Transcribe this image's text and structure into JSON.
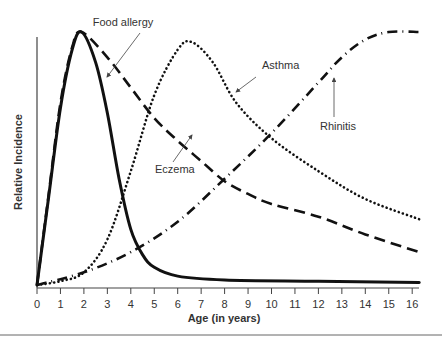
{
  "chart_data": {
    "type": "line",
    "title": "",
    "xlabel": "Age (in years)",
    "ylabel": "Relative Incidence",
    "xlim": [
      0,
      16.3
    ],
    "ylim": [
      0,
      100
    ],
    "grid": false,
    "legend": "inline annotations with arrows",
    "x_ticks": [
      "0",
      "1",
      "2",
      "3",
      "4",
      "5",
      "6",
      "7",
      "8",
      "9",
      "10",
      "11",
      "12",
      "13",
      "14",
      "15",
      "16"
    ],
    "series": [
      {
        "name": "Food allergy",
        "style": "solid",
        "points": [
          [
            0,
            0
          ],
          [
            0.5,
            35
          ],
          [
            1,
            70
          ],
          [
            1.5,
            93
          ],
          [
            1.9,
            100
          ],
          [
            2.5,
            88
          ],
          [
            3,
            68
          ],
          [
            3.5,
            42
          ],
          [
            4,
            22
          ],
          [
            4.5,
            12
          ],
          [
            5,
            7
          ],
          [
            6,
            3.5
          ],
          [
            8,
            2
          ],
          [
            12,
            1.5
          ],
          [
            16.3,
            1
          ]
        ]
      },
      {
        "name": "Eczema",
        "style": "dashed",
        "points": [
          [
            0,
            0
          ],
          [
            0.5,
            36
          ],
          [
            1,
            72
          ],
          [
            1.5,
            94
          ],
          [
            1.9,
            100
          ],
          [
            3,
            90
          ],
          [
            4,
            78
          ],
          [
            5,
            66
          ],
          [
            6,
            57
          ],
          [
            7,
            49
          ],
          [
            8,
            41
          ],
          [
            9,
            36
          ],
          [
            10,
            32
          ],
          [
            12,
            27
          ],
          [
            14,
            20
          ],
          [
            16.3,
            13
          ]
        ]
      },
      {
        "name": "Asthma",
        "style": "dotted",
        "points": [
          [
            0,
            0
          ],
          [
            1,
            1.5
          ],
          [
            2,
            5
          ],
          [
            3,
            18
          ],
          [
            4,
            45
          ],
          [
            5,
            75
          ],
          [
            6,
            93
          ],
          [
            6.6,
            96
          ],
          [
            7.5,
            88
          ],
          [
            8.5,
            72
          ],
          [
            10,
            58
          ],
          [
            12,
            45
          ],
          [
            14,
            34
          ],
          [
            16.3,
            26
          ]
        ]
      },
      {
        "name": "Rhinitis",
        "style": "dash-dot",
        "points": [
          [
            0,
            0
          ],
          [
            2,
            5
          ],
          [
            4,
            13
          ],
          [
            6,
            25
          ],
          [
            8,
            42
          ],
          [
            10,
            60
          ],
          [
            12,
            80
          ],
          [
            13,
            90
          ],
          [
            14,
            97
          ],
          [
            15,
            100
          ],
          [
            16.3,
            100
          ]
        ]
      }
    ],
    "annotations": [
      {
        "text": "Food allergy",
        "points_to": "Food allergy"
      },
      {
        "text": "Eczema",
        "points_to": "Eczema"
      },
      {
        "text": "Asthma",
        "points_to": "Asthma"
      },
      {
        "text": "Rhinitis",
        "points_to": "Rhinitis"
      }
    ]
  },
  "labels": {
    "xlabel": "Age (in years)",
    "ylabel": "Relative Incidence",
    "food_allergy": "Food allergy",
    "eczema": "Eczema",
    "asthma": "Asthma",
    "rhinitis": "Rhinitis"
  }
}
